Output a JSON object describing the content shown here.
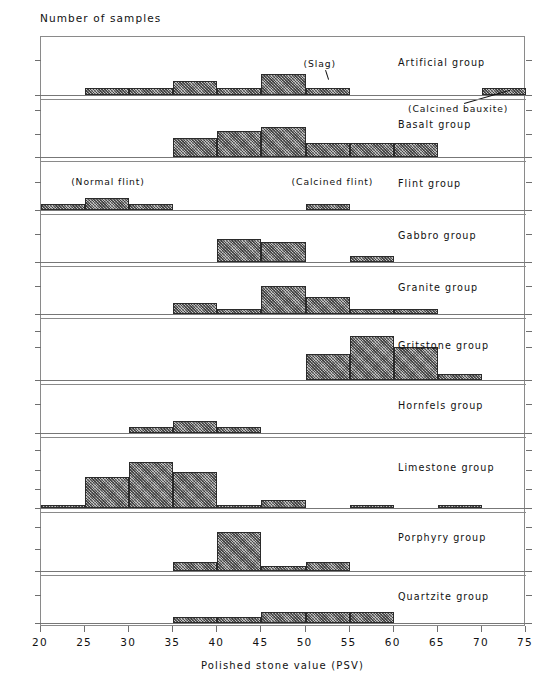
{
  "chart_data": {
    "type": "bar",
    "title": "",
    "ylabel": "Number of samples",
    "xlabel": "Polished stone value (PSV)",
    "xlim": [
      20,
      75
    ],
    "xticks": [
      20,
      25,
      30,
      35,
      40,
      45,
      50,
      55,
      60,
      65,
      70,
      75
    ],
    "bin_width": 5,
    "grid": false,
    "legend": "none",
    "note": "Stacked small-multiple histogram panels, one per aggregate rock group. Each panel shares the PSV x axis; y axis is number of samples.",
    "panels": [
      {
        "name": "Artificial group",
        "ylim": [
          0,
          7.5
        ],
        "yticks": [
          0,
          5
        ],
        "bars": [
          {
            "x0": 25,
            "x1": 30,
            "value": 1
          },
          {
            "x0": 30,
            "x1": 35,
            "value": 1
          },
          {
            "x0": 35,
            "x1": 40,
            "value": 2
          },
          {
            "x0": 40,
            "x1": 45,
            "value": 1
          },
          {
            "x0": 45,
            "x1": 50,
            "value": 3
          },
          {
            "x0": 50,
            "x1": 55,
            "value": 1
          },
          {
            "x0": 70,
            "x1": 75,
            "value": 1
          }
        ],
        "annotations": [
          {
            "text": "(Slag)",
            "x": 52.5,
            "points_to": 52.5
          },
          {
            "text": "(Calcined bauxite)",
            "x": 72.5,
            "points_to": 72.5
          }
        ]
      },
      {
        "name": "Basalt group",
        "ylim": [
          0,
          11
        ],
        "yticks": [
          0,
          5,
          10
        ],
        "bars": [
          {
            "x0": 35,
            "x1": 40,
            "value": 4
          },
          {
            "x0": 40,
            "x1": 45,
            "value": 5.5
          },
          {
            "x0": 45,
            "x1": 50,
            "value": 6.5
          },
          {
            "x0": 50,
            "x1": 55,
            "value": 3
          },
          {
            "x0": 55,
            "x1": 60,
            "value": 3
          },
          {
            "x0": 60,
            "x1": 65,
            "value": 3
          }
        ],
        "annotations": []
      },
      {
        "name": "Flint group",
        "ylim": [
          0,
          7.5
        ],
        "yticks": [
          0,
          5
        ],
        "bars": [
          {
            "x0": 20,
            "x1": 25,
            "value": 1
          },
          {
            "x0": 25,
            "x1": 30,
            "value": 2
          },
          {
            "x0": 30,
            "x1": 35,
            "value": 1
          },
          {
            "x0": 50,
            "x1": 55,
            "value": 1
          }
        ],
        "annotations": [
          {
            "text": "(Normal flint)",
            "x": 27.5,
            "points_to": null
          },
          {
            "text": "(Calcined flint)",
            "x": 52.5,
            "points_to": null
          }
        ]
      },
      {
        "name": "Gabbro group",
        "ylim": [
          0,
          7.5
        ],
        "yticks": [
          0,
          5
        ],
        "bars": [
          {
            "x0": 40,
            "x1": 45,
            "value": 4
          },
          {
            "x0": 45,
            "x1": 50,
            "value": 3.5
          },
          {
            "x0": 55,
            "x1": 60,
            "value": 1
          }
        ],
        "annotations": []
      },
      {
        "name": "Granite group",
        "ylim": [
          0,
          7.5
        ],
        "yticks": [
          0,
          5
        ],
        "bars": [
          {
            "x0": 35,
            "x1": 40,
            "value": 2
          },
          {
            "x0": 40,
            "x1": 45,
            "value": 1
          },
          {
            "x0": 45,
            "x1": 50,
            "value": 5
          },
          {
            "x0": 50,
            "x1": 55,
            "value": 3
          },
          {
            "x0": 55,
            "x1": 60,
            "value": 1
          },
          {
            "x0": 60,
            "x1": 65,
            "value": 1
          }
        ],
        "annotations": []
      },
      {
        "name": "Gritstone group",
        "ylim": [
          0,
          17
        ],
        "yticks": [
          0,
          10,
          15
        ],
        "bars": [
          {
            "x0": 50,
            "x1": 55,
            "value": 8
          },
          {
            "x0": 55,
            "x1": 60,
            "value": 13.5
          },
          {
            "x0": 60,
            "x1": 65,
            "value": 10
          },
          {
            "x0": 65,
            "x1": 70,
            "value": 2
          }
        ],
        "annotations": []
      },
      {
        "name": "Hornfels group",
        "ylim": [
          0,
          7.5
        ],
        "yticks": [
          0,
          5
        ],
        "bars": [
          {
            "x0": 30,
            "x1": 35,
            "value": 1
          },
          {
            "x0": 35,
            "x1": 40,
            "value": 2
          },
          {
            "x0": 40,
            "x1": 45,
            "value": 1
          }
        ],
        "annotations": []
      },
      {
        "name": "Limestone group",
        "ylim": [
          0,
          17
        ],
        "yticks": [
          0,
          5,
          10,
          15
        ],
        "bars": [
          {
            "x0": 20,
            "x1": 25,
            "value": 1
          },
          {
            "x0": 25,
            "x1": 30,
            "value": 8
          },
          {
            "x0": 30,
            "x1": 35,
            "value": 12
          },
          {
            "x0": 35,
            "x1": 40,
            "value": 9.3
          },
          {
            "x0": 40,
            "x1": 45,
            "value": 1
          },
          {
            "x0": 45,
            "x1": 50,
            "value": 2.3
          },
          {
            "x0": 55,
            "x1": 60,
            "value": 1
          },
          {
            "x0": 65,
            "x1": 70,
            "value": 1
          }
        ],
        "annotations": []
      },
      {
        "name": "Porphyry group",
        "ylim": [
          0,
          12
        ],
        "yticks": [
          0,
          5,
          10
        ],
        "bars": [
          {
            "x0": 35,
            "x1": 40,
            "value": 2
          },
          {
            "x0": 40,
            "x1": 45,
            "value": 8.8
          },
          {
            "x0": 45,
            "x1": 50,
            "value": 1
          },
          {
            "x0": 50,
            "x1": 55,
            "value": 2
          }
        ],
        "annotations": []
      },
      {
        "name": "Quartzite group",
        "ylim": [
          0,
          7.5
        ],
        "yticks": [
          0,
          5
        ],
        "bars": [
          {
            "x0": 35,
            "x1": 40,
            "value": 1
          },
          {
            "x0": 40,
            "x1": 45,
            "value": 1
          },
          {
            "x0": 45,
            "x1": 50,
            "value": 2
          },
          {
            "x0": 50,
            "x1": 55,
            "value": 2
          },
          {
            "x0": 55,
            "x1": 60,
            "value": 2
          }
        ],
        "annotations": []
      }
    ]
  },
  "colors": {
    "bar_fill": "#8d8d8d",
    "bar_edge": "#2b2b2b",
    "axis": "#6f6f6f",
    "frame": "#8a8a8a",
    "text": "#111111"
  }
}
